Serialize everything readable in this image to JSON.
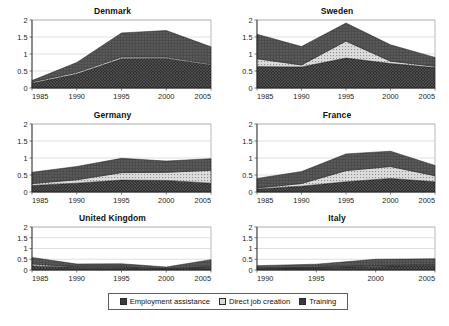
{
  "figure": {
    "caption": "",
    "axis": {
      "y_ticks": [
        "0",
        "0.5",
        "1",
        "1.5",
        "2"
      ],
      "ylim": [
        0,
        2
      ]
    }
  },
  "legend": {
    "position": "bottom-center",
    "items": [
      {
        "label": "Employment assistance",
        "color": "#3a3a3a",
        "pattern": "solid-dark"
      },
      {
        "label": "Direct job creation",
        "color": "#d2d2d2",
        "pattern": "dotted-light"
      },
      {
        "label": "Training",
        "color": "#4a4a4a",
        "pattern": "crosshatch-dark"
      }
    ]
  },
  "colors": {
    "training": "#2e2e2e",
    "direct_job_creation": "#d8d8d8",
    "employment_assistance": "#555555",
    "axis": "#555555",
    "gridline": "#c9c9c9",
    "plot_border": "#9a9a9a"
  },
  "chart_data": [
    {
      "type": "area",
      "title": "Denmark",
      "xlabel": "",
      "ylabel": "",
      "xlim": [
        1985,
        2005
      ],
      "ylim": [
        0,
        2
      ],
      "grid": true,
      "stacked": true,
      "x": [
        1985,
        1990,
        1995,
        2000,
        2005
      ],
      "xtick_labels": [
        "1985",
        "1990",
        "1995",
        "2000",
        "2005"
      ],
      "ytick_labels": [
        "0",
        "0.5",
        "1",
        "1.5",
        "2"
      ],
      "series": [
        {
          "name": "Training",
          "values": [
            0.14,
            0.41,
            0.86,
            0.87,
            0.68
          ]
        },
        {
          "name": "Direct job creation",
          "values": [
            0.04,
            0.05,
            0.05,
            0.04,
            0.03
          ]
        },
        {
          "name": "Employment assistance",
          "values": [
            0.04,
            0.29,
            0.71,
            0.78,
            0.5
          ]
        }
      ],
      "totals": [
        0.22,
        0.75,
        1.62,
        1.69,
        1.21
      ]
    },
    {
      "type": "area",
      "title": "Sweden",
      "xlabel": "",
      "ylabel": "",
      "xlim": [
        1985,
        2005
      ],
      "ylim": [
        0,
        2
      ],
      "grid": true,
      "stacked": true,
      "x": [
        1985,
        1990,
        1995,
        2000,
        2005
      ],
      "xtick_labels": [
        "1985",
        "1990",
        "1995",
        "2000",
        "2005"
      ],
      "ytick_labels": [
        "0",
        "0.5",
        "1",
        "1.5",
        "2"
      ],
      "series": [
        {
          "name": "Training",
          "values": [
            0.63,
            0.62,
            0.88,
            0.72,
            0.6
          ]
        },
        {
          "name": "Direct job creation",
          "values": [
            0.23,
            0.06,
            0.5,
            0.07,
            0.04
          ]
        },
        {
          "name": "Employment assistance",
          "values": [
            0.72,
            0.54,
            0.53,
            0.48,
            0.26
          ]
        }
      ],
      "totals": [
        1.58,
        1.22,
        1.91,
        1.27,
        0.9
      ]
    },
    {
      "type": "area",
      "title": "Germany",
      "xlabel": "",
      "ylabel": "",
      "xlim": [
        1985,
        2005
      ],
      "ylim": [
        0,
        2
      ],
      "grid": true,
      "stacked": true,
      "x": [
        1985,
        1990,
        1995,
        2000,
        2005
      ],
      "xtick_labels": [
        "1985",
        "1990",
        "1995",
        "2000",
        "2005"
      ],
      "ytick_labels": [
        "0",
        "0.5",
        "1",
        "1.5",
        "2"
      ],
      "series": [
        {
          "name": "Training",
          "values": [
            0.19,
            0.26,
            0.35,
            0.34,
            0.26
          ]
        },
        {
          "name": "Direct job creation",
          "values": [
            0.06,
            0.1,
            0.22,
            0.24,
            0.38
          ]
        },
        {
          "name": "Employment assistance",
          "values": [
            0.33,
            0.39,
            0.42,
            0.33,
            0.34
          ]
        }
      ],
      "totals": [
        0.58,
        0.75,
        0.99,
        0.91,
        0.98
      ]
    },
    {
      "type": "area",
      "title": "France",
      "xlabel": "",
      "ylabel": "",
      "xlim": [
        1985,
        2005
      ],
      "ylim": [
        0,
        2
      ],
      "grid": true,
      "stacked": true,
      "x": [
        1985,
        1990,
        1995,
        2000,
        2005
      ],
      "xtick_labels": [
        "1985",
        "1990",
        "1995",
        "2000",
        "2005"
      ],
      "ytick_labels": [
        "0",
        "0.5",
        "1",
        "1.5",
        "2"
      ],
      "series": [
        {
          "name": "Training",
          "values": [
            0.09,
            0.17,
            0.3,
            0.4,
            0.3
          ]
        },
        {
          "name": "Direct job creation",
          "values": [
            0.03,
            0.08,
            0.33,
            0.35,
            0.18
          ]
        },
        {
          "name": "Employment assistance",
          "values": [
            0.28,
            0.35,
            0.49,
            0.45,
            0.3
          ]
        }
      ],
      "totals": [
        0.4,
        0.6,
        1.12,
        1.2,
        0.78
      ]
    },
    {
      "type": "area",
      "title": "United Kingdom",
      "xlabel": "",
      "ylabel": "",
      "xlim": [
        1985,
        2005
      ],
      "ylim": [
        0,
        2
      ],
      "grid": true,
      "stacked": true,
      "x": [
        1985,
        1990,
        1995,
        2000,
        2005
      ],
      "xtick_labels": [
        "1985",
        "1990",
        "1995",
        "2000",
        "2005"
      ],
      "ytick_labels": [
        "0",
        "0.5",
        "1",
        "1.5",
        "2"
      ],
      "series": [
        {
          "name": "Training",
          "values": [
            0.19,
            0.13,
            0.12,
            0.05,
            0.13
          ]
        },
        {
          "name": "Direct job creation",
          "values": [
            0.09,
            0.02,
            0.02,
            0.01,
            0.02
          ]
        },
        {
          "name": "Employment assistance",
          "values": [
            0.3,
            0.13,
            0.15,
            0.08,
            0.33
          ]
        }
      ],
      "totals": [
        0.58,
        0.28,
        0.29,
        0.14,
        0.48
      ]
    },
    {
      "type": "area",
      "title": "Italy",
      "xlabel": "",
      "ylabel": "",
      "xlim": [
        1990,
        2005
      ],
      "ylim": [
        0,
        2
      ],
      "grid": true,
      "stacked": true,
      "x": [
        1990,
        1995,
        2000,
        2005
      ],
      "xtick_labels": [
        "1990",
        "1995",
        "2000",
        "2005"
      ],
      "ytick_labels": [
        "0",
        "0.5",
        "1",
        "1.5",
        "2"
      ],
      "series": [
        {
          "name": "Training",
          "values": [
            0.08,
            0.1,
            0.18,
            0.22
          ]
        },
        {
          "name": "Direct job creation",
          "values": [
            0.02,
            0.02,
            0.03,
            0.03
          ]
        },
        {
          "name": "Employment assistance",
          "values": [
            0.1,
            0.15,
            0.29,
            0.27
          ]
        }
      ],
      "totals": [
        0.2,
        0.27,
        0.5,
        0.52
      ]
    }
  ]
}
